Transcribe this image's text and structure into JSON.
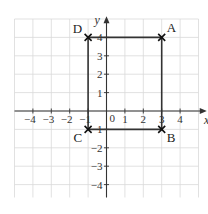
{
  "diagram": {
    "axes": {
      "x_label": "x",
      "y_label": "y",
      "x_ticks": [
        "−4",
        "−3",
        "−2",
        "−1",
        "1",
        "2",
        "3",
        "4"
      ],
      "x_tick_values": [
        -4,
        -3,
        -2,
        -1,
        1,
        2,
        3,
        4
      ],
      "y_ticks": [
        "1",
        "2",
        "3",
        "4",
        "−1",
        "−2",
        "−3",
        "−4"
      ],
      "y_tick_values": [
        1,
        2,
        3,
        4,
        -1,
        -2,
        -3,
        -4
      ],
      "origin_label": "0",
      "x_range": [
        -5,
        5
      ],
      "y_range": [
        -5,
        5
      ]
    },
    "points": [
      {
        "label": "A",
        "x": 3,
        "y": 4
      },
      {
        "label": "B",
        "x": 3,
        "y": -1
      },
      {
        "label": "C",
        "x": -1,
        "y": -1
      },
      {
        "label": "D",
        "x": -1,
        "y": 4
      }
    ],
    "colors": {
      "grid": "#d9d9d9",
      "axis": "#333333",
      "shape": "#333333"
    }
  }
}
